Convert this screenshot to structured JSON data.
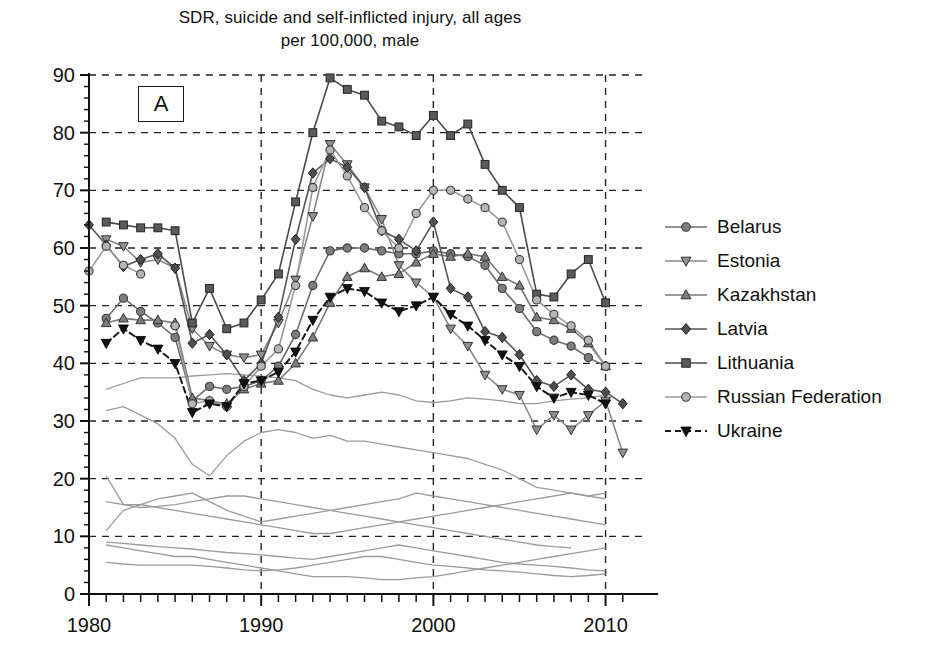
{
  "chart_data": {
    "type": "line",
    "title": "SDR, suicide and self-inflicted injury, all ages per 100,000, male",
    "title_line1": "SDR, suicide and self-inflicted injury, all ages",
    "title_line2": "per 100,000, male",
    "panel_label": "A",
    "xlabel": "",
    "ylabel": "",
    "xlim": [
      1980,
      2012
    ],
    "ylim": [
      0,
      90
    ],
    "yticks": [
      0,
      10,
      20,
      30,
      40,
      50,
      60,
      70,
      80,
      90
    ],
    "ytick_labels": [
      "0",
      "10",
      "20",
      "30",
      "40",
      "50",
      "60",
      "70",
      "80",
      "90"
    ],
    "xticks": [
      1980,
      1990,
      2000,
      2010
    ],
    "xtick_labels": [
      "1980",
      "1990",
      "2000",
      "2010"
    ],
    "x_minor_tick_step": 1,
    "grid": "dashed horizontal at every y tick; dashed vertical at 1990, 2000, 2010",
    "legend_position": "right",
    "x": [
      1980,
      1981,
      1982,
      1983,
      1984,
      1985,
      1986,
      1987,
      1988,
      1989,
      1990,
      1991,
      1992,
      1993,
      1994,
      1995,
      1996,
      1997,
      1998,
      1999,
      2000,
      2001,
      2002,
      2003,
      2004,
      2005,
      2006,
      2007,
      2008,
      2009,
      2010,
      2011
    ],
    "series": [
      {
        "name": "Belarus",
        "marker": "circle",
        "color": "#6d6d6d",
        "dash": "solid",
        "values": [
          null,
          47.8,
          51.3,
          49.0,
          47.0,
          44.5,
          33.5,
          36.0,
          35.5,
          36.0,
          37.0,
          39.5,
          45.0,
          53.5,
          59.5,
          60.0,
          60.0,
          59.5,
          59.0,
          59.0,
          59.5,
          59.0,
          58.5,
          57.0,
          53.0,
          49.5,
          45.5,
          44.0,
          43.0,
          41.0,
          39.5,
          null
        ]
      },
      {
        "name": "Estonia",
        "marker": "triangle-down",
        "color": "#8a8a8a",
        "dash": "solid",
        "values": [
          null,
          61.5,
          60.3,
          57.5,
          58.0,
          56.5,
          46.0,
          43.0,
          41.5,
          41.0,
          41.5,
          47.0,
          54.5,
          65.5,
          78.0,
          74.5,
          70.5,
          65.0,
          57.0,
          54.0,
          51.5,
          46.0,
          43.0,
          38.0,
          35.5,
          34.5,
          28.5,
          31.0,
          28.5,
          31.0,
          33.5,
          24.5
        ]
      },
      {
        "name": "Kazakhstan",
        "marker": "triangle-up",
        "color": "#7a7a7a",
        "dash": "solid",
        "values": [
          null,
          47.0,
          47.8,
          47.5,
          47.5,
          47.0,
          34.0,
          33.5,
          33.0,
          35.5,
          36.5,
          37.0,
          40.0,
          44.5,
          50.5,
          55.0,
          56.5,
          55.0,
          55.5,
          57.5,
          59.0,
          58.5,
          59.0,
          58.5,
          55.0,
          53.5,
          48.0,
          47.5,
          46.0,
          43.5,
          39.5,
          null
        ]
      },
      {
        "name": "Latvia",
        "marker": "diamond",
        "color": "#555555",
        "dash": "solid",
        "values": [
          64.0,
          60.5,
          56.8,
          58.0,
          59.0,
          56.5,
          43.5,
          45.0,
          41.5,
          37.0,
          40.0,
          48.0,
          61.5,
          73.0,
          75.5,
          74.0,
          70.5,
          63.0,
          61.5,
          59.5,
          64.5,
          53.0,
          51.5,
          45.5,
          44.5,
          41.5,
          37.0,
          36.0,
          38.0,
          35.5,
          35.0,
          33.0
        ]
      },
      {
        "name": "Lithuania",
        "marker": "square",
        "color": "#4a4a4a",
        "dash": "solid",
        "values": [
          null,
          64.5,
          64.0,
          63.5,
          63.5,
          63.0,
          47.0,
          53.0,
          46.0,
          47.0,
          51.0,
          55.5,
          68.0,
          80.0,
          89.5,
          87.5,
          86.5,
          82.0,
          81.0,
          79.5,
          83.0,
          79.5,
          81.5,
          74.5,
          70.0,
          67.0,
          52.0,
          51.5,
          55.5,
          58.0,
          50.5,
          null
        ]
      },
      {
        "name": "Russian Federation",
        "marker": "circle-light",
        "color": "#9a9a9a",
        "dash": "solid",
        "values": [
          56.0,
          60.3,
          57.0,
          55.5,
          null,
          46.5,
          33.0,
          33.5,
          32.5,
          36.0,
          39.5,
          42.5,
          53.5,
          70.5,
          77.0,
          72.5,
          67.0,
          63.0,
          60.0,
          66.0,
          70.0,
          70.0,
          68.5,
          67.0,
          64.5,
          58.0,
          51.0,
          48.5,
          46.5,
          44.0,
          39.5,
          null
        ]
      },
      {
        "name": "Ukraine",
        "marker": "triangle-down-filled",
        "color": "#1a1a1a",
        "dash": "dashed",
        "values": [
          null,
          43.5,
          46.0,
          44.0,
          42.5,
          40.0,
          31.5,
          33.0,
          32.5,
          36.5,
          37.0,
          38.5,
          42.0,
          47.5,
          51.5,
          53.0,
          52.5,
          50.5,
          49.0,
          50.0,
          51.5,
          48.5,
          46.5,
          44.0,
          41.5,
          39.5,
          36.0,
          34.0,
          35.0,
          34.5,
          33.0,
          null
        ]
      }
    ],
    "background_series": [
      {
        "name": "background-line-1",
        "color": "#9b9b9b",
        "values": [
          null,
          35.5,
          36.5,
          37.5,
          37.5,
          37.5,
          37.8,
          38.0,
          38.2,
          38.0,
          37.8,
          37.5,
          37.0,
          35.5,
          34.5,
          34.0,
          34.5,
          35.0,
          34.5,
          33.5,
          33.2,
          33.5,
          34.0,
          33.8,
          33.5,
          33.0,
          33.0,
          33.5,
          33.8,
          34.0,
          34.5,
          null
        ]
      },
      {
        "name": "background-line-2",
        "color": "#9b9b9b",
        "values": [
          null,
          31.8,
          32.5,
          31.0,
          29.5,
          27.0,
          22.5,
          20.5,
          24.0,
          26.5,
          28.0,
          28.5,
          28.0,
          27.0,
          27.5,
          26.5,
          26.5,
          26.0,
          25.5,
          25.0,
          24.5,
          24.0,
          23.5,
          22.5,
          21.5,
          20.0,
          18.5,
          18.0,
          17.5,
          17.0,
          17.5,
          null
        ]
      },
      {
        "name": "background-line-3",
        "color": "#9b9b9b",
        "values": [
          null,
          20.5,
          15.5,
          15.0,
          15.2,
          15.5,
          16.0,
          16.5,
          17.0,
          17.0,
          16.5,
          16.0,
          15.5,
          15.0,
          14.5,
          14.0,
          13.5,
          13.0,
          12.5,
          12.0,
          11.5,
          11.0,
          10.5,
          10.0,
          9.5,
          9.0,
          8.5,
          8.2,
          8.0,
          null,
          null
        ]
      },
      {
        "name": "background-line-4",
        "color": "#9b9b9b",
        "values": [
          null,
          11.0,
          14.5,
          15.5,
          16.5,
          17.0,
          17.5,
          16.0,
          14.5,
          13.5,
          12.5,
          13.0,
          13.5,
          14.0,
          14.5,
          15.0,
          15.5,
          16.0,
          16.5,
          17.5,
          17.0,
          16.5,
          16.0,
          15.5,
          15.0,
          14.5,
          14.0,
          13.5,
          13.0,
          12.5,
          12.0,
          null
        ]
      },
      {
        "name": "background-line-5",
        "color": "#9b9b9b",
        "values": [
          null,
          16.0,
          15.5,
          15.5,
          15.0,
          14.5,
          14.0,
          13.5,
          13.0,
          12.5,
          12.0,
          11.5,
          11.0,
          10.5,
          10.5,
          11.0,
          11.5,
          12.0,
          12.5,
          13.0,
          13.5,
          14.0,
          14.5,
          15.0,
          15.5,
          16.0,
          16.5,
          17.0,
          17.5,
          17.0,
          16.5,
          null
        ]
      },
      {
        "name": "background-line-6",
        "color": "#9b9b9b",
        "values": [
          null,
          9.0,
          8.8,
          8.5,
          8.2,
          8.0,
          7.8,
          7.5,
          7.2,
          7.0,
          6.8,
          6.5,
          6.2,
          6.0,
          6.5,
          7.0,
          7.5,
          8.0,
          8.5,
          8.0,
          7.5,
          7.0,
          6.5,
          6.0,
          5.5,
          5.2,
          5.0,
          4.8,
          4.5,
          4.2,
          4.0,
          null
        ]
      },
      {
        "name": "background-line-7",
        "color": "#9b9b9b",
        "values": [
          null,
          5.5,
          5.2,
          5.0,
          5.0,
          5.0,
          5.0,
          4.8,
          4.5,
          4.2,
          4.0,
          4.2,
          4.5,
          5.0,
          5.5,
          6.0,
          6.5,
          6.5,
          6.0,
          5.5,
          5.0,
          4.8,
          4.5,
          4.2,
          4.0,
          3.8,
          3.5,
          3.2,
          3.0,
          3.2,
          3.5,
          null
        ]
      },
      {
        "name": "background-line-8",
        "color": "#9b9b9b",
        "values": [
          null,
          8.5,
          8.0,
          7.5,
          7.0,
          6.5,
          6.5,
          6.0,
          5.5,
          5.0,
          4.5,
          4.0,
          3.5,
          3.0,
          3.0,
          3.0,
          2.8,
          2.5,
          2.5,
          2.8,
          3.0,
          3.5,
          4.0,
          4.5,
          5.0,
          5.5,
          6.0,
          6.5,
          7.0,
          7.5,
          8.0,
          null
        ]
      }
    ]
  },
  "legend": {
    "items": [
      {
        "label": "Belarus"
      },
      {
        "label": "Estonia"
      },
      {
        "label": "Kazakhstan"
      },
      {
        "label": "Latvia"
      },
      {
        "label": "Lithuania"
      },
      {
        "label": "Russian Federation"
      },
      {
        "label": "Ukraine"
      }
    ]
  }
}
